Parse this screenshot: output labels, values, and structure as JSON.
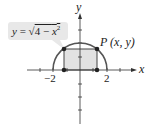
{
  "diagram": {
    "equation_label": "y = √(4 − x²)",
    "equation_parts": {
      "lhs": "y",
      "eq": " = ",
      "sqrt": "√",
      "radicand_num": "4 − ",
      "radicand_var": "x",
      "exp": "2"
    },
    "point_label": "P (x, y)",
    "x_axis_label": "x",
    "y_axis_label": "y",
    "tick_labels": {
      "neg2": "−2",
      "pos2": "2"
    },
    "colors": {
      "curve": "#555555",
      "rect_fill": "#e2e2e2",
      "callout_bg": "#e8e8e8",
      "axis": "#333333",
      "point": "#222222"
    }
  }
}
